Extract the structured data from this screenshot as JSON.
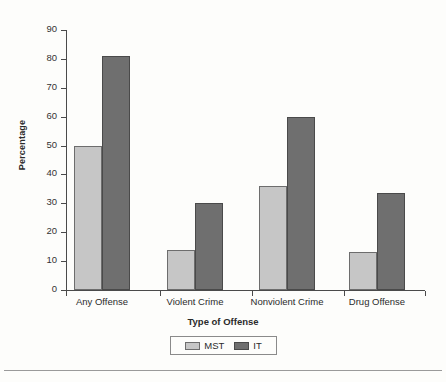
{
  "chart_data": {
    "type": "bar",
    "title": "",
    "xlabel": "Type of Offense",
    "ylabel": "Percentage",
    "categories": [
      "Any Offense",
      "Violent Crime",
      "Nonviolent Crime",
      "Drug Offense"
    ],
    "series": [
      {
        "name": "MST",
        "color": "#c6c6c6",
        "values": [
          50,
          14,
          36,
          13
        ]
      },
      {
        "name": "IT",
        "color": "#6f6f6f",
        "values": [
          81,
          30,
          60,
          33.5
        ]
      }
    ],
    "ylim": [
      0,
      90
    ],
    "ytick_step": 10,
    "yticks": [
      0,
      10,
      20,
      30,
      40,
      50,
      60,
      70,
      80,
      90
    ],
    "ytick_labels": [
      "0",
      "10",
      "20",
      "30",
      "40",
      "50",
      "60",
      "70",
      "80",
      "90"
    ],
    "grid": false,
    "legend_position": "bottom-center",
    "legend_entries": [
      "MST",
      "IT"
    ]
  },
  "axis": {
    "y_title": "Percentage",
    "x_title": "Type of Offense"
  }
}
